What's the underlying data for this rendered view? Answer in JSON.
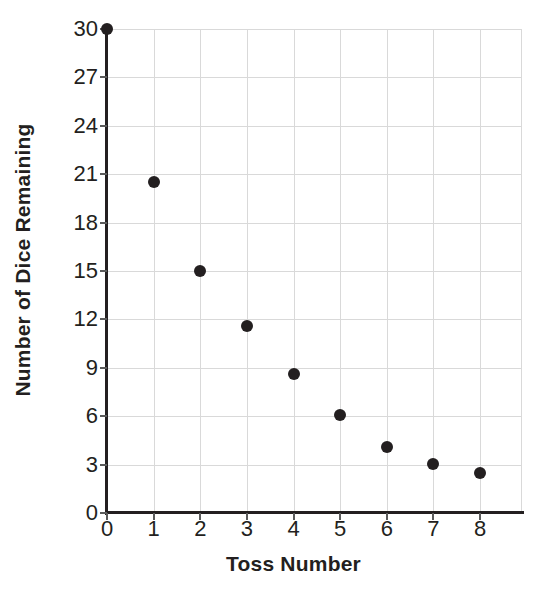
{
  "chart_data": {
    "type": "scatter",
    "title": "",
    "xlabel": "Toss Number",
    "ylabel": "Number of Dice Remaining",
    "x": [
      0,
      1,
      2,
      3,
      4,
      5,
      6,
      7,
      8
    ],
    "values": [
      30,
      20.5,
      15,
      11.6,
      8.6,
      6.1,
      4.1,
      3.05,
      2.5
    ],
    "xlim": [
      0,
      8
    ],
    "ylim": [
      0,
      30
    ],
    "xticks": [
      "0",
      "1",
      "2",
      "3",
      "4",
      "5",
      "6",
      "7",
      "8"
    ],
    "yticks": [
      "0",
      "3",
      "6",
      "9",
      "12",
      "15",
      "18",
      "21",
      "24",
      "27",
      "30"
    ],
    "xtick_values": [
      0,
      1,
      2,
      3,
      4,
      5,
      6,
      7,
      8
    ],
    "ytick_values": [
      0,
      3,
      6,
      9,
      12,
      15,
      18,
      21,
      24,
      27,
      30
    ],
    "grid": true,
    "legend": null,
    "marker_color": "#231f20",
    "grid_color": "#d9d9d9",
    "axis_color": "#231f20",
    "background": "#ffffff"
  }
}
